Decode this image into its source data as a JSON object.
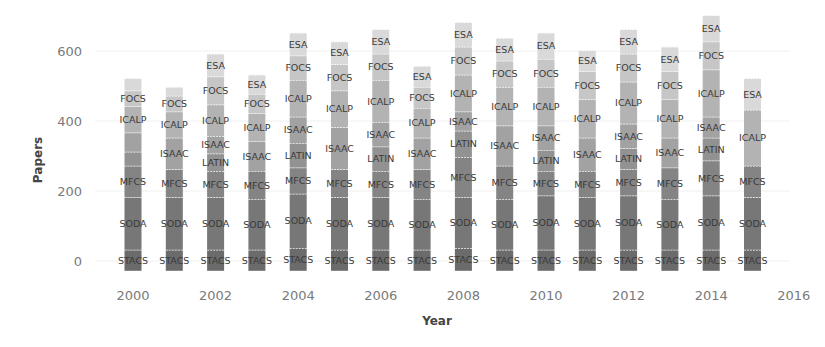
{
  "chart_data": {
    "type": "bar",
    "stacked": true,
    "title": "",
    "xlabel": "Year",
    "ylabel": "Papers",
    "ylim": [
      -28,
      700
    ],
    "yticks": [
      0,
      200,
      400,
      600
    ],
    "xticks": [
      "2000",
      "2002",
      "2004",
      "2006",
      "2008",
      "2010",
      "2012",
      "2014",
      "2016"
    ],
    "grid": false,
    "legend": "none (segments labeled inline)",
    "categories": [
      "2000",
      "2001",
      "2002",
      "2003",
      "2004",
      "2005",
      "2006",
      "2007",
      "2008",
      "2009",
      "2010",
      "2011",
      "2012",
      "2013",
      "2014",
      "2015"
    ],
    "series_order_bottom_to_top": [
      "STACS",
      "SODA",
      "MFCS",
      "LATIN",
      "ISAAC",
      "ICALP",
      "FOCS",
      "ESA"
    ],
    "colors": {
      "STACS": "#6b6b6b",
      "SODA": "#777777",
      "MFCS": "#848484",
      "LATIN": "#929292",
      "ISAAC": "#a2a2a2",
      "ICALP": "#b3b3b3",
      "FOCS": "#c6c6c6",
      "ESA": "#d9d9d9"
    },
    "bars": [
      {
        "year": "2000",
        "segments": [
          [
            "STACS",
            60
          ],
          [
            "SODA",
            150
          ],
          [
            "MFCS",
            90
          ],
          [
            "LATIN",
            40
          ],
          [
            "ISAAC",
            55
          ],
          [
            "ICALP",
            75
          ],
          [
            "FOCS",
            45
          ],
          [
            "ESA",
            35
          ]
        ],
        "labels": [
          "STACS",
          "SODA",
          "MFCS",
          "ICALP",
          "FOCS"
        ]
      },
      {
        "year": "2001",
        "segments": [
          [
            "STACS",
            60
          ],
          [
            "SODA",
            150
          ],
          [
            "MFCS",
            80
          ],
          [
            "ISAAC",
            90
          ],
          [
            "ICALP",
            75
          ],
          [
            "FOCS",
            45
          ],
          [
            "ESA",
            25
          ]
        ],
        "labels": [
          "STACS",
          "SODA",
          "MFCS",
          "ISAAC",
          "ICALP",
          "FOCS"
        ]
      },
      {
        "year": "2002",
        "segments": [
          [
            "STACS",
            60
          ],
          [
            "SODA",
            150
          ],
          [
            "MFCS",
            75
          ],
          [
            "LATIN",
            50
          ],
          [
            "ISAAC",
            50
          ],
          [
            "ICALP",
            90
          ],
          [
            "FOCS",
            80
          ],
          [
            "ESA",
            65
          ]
        ],
        "labels": [
          "STACS",
          "SODA",
          "MFCS",
          "LATIN",
          "ISAAC",
          "ICALP",
          "FOCS",
          "ESA"
        ]
      },
      {
        "year": "2003",
        "segments": [
          [
            "STACS",
            60
          ],
          [
            "SODA",
            145
          ],
          [
            "MFCS",
            80
          ],
          [
            "ISAAC",
            85
          ],
          [
            "ICALP",
            80
          ],
          [
            "FOCS",
            55
          ],
          [
            "ESA",
            55
          ]
        ],
        "labels": [
          "STACS",
          "SODA",
          "MFCS",
          "ISAAC",
          "ICALP",
          "FOCS",
          "ESA"
        ]
      },
      {
        "year": "2004",
        "segments": [
          [
            "STACS",
            65
          ],
          [
            "SODA",
            155
          ],
          [
            "MFCS",
            75
          ],
          [
            "LATIN",
            70
          ],
          [
            "ISAAC",
            75
          ],
          [
            "ICALP",
            105
          ],
          [
            "FOCS",
            70
          ],
          [
            "ESA",
            65
          ]
        ],
        "labels": [
          "STACS",
          "SODA",
          "MFCS",
          "LATIN",
          "ISAAC",
          "ICALP",
          "FOCS",
          "ESA"
        ]
      },
      {
        "year": "2005",
        "segments": [
          [
            "STACS",
            60
          ],
          [
            "SODA",
            150
          ],
          [
            "MFCS",
            80
          ],
          [
            "ISAAC",
            120
          ],
          [
            "ICALP",
            105
          ],
          [
            "FOCS",
            75
          ],
          [
            "ESA",
            65
          ]
        ],
        "labels": [
          "STACS",
          "SODA",
          "MFCS",
          "ISAAC",
          "ICALP",
          "FOCS",
          "ESA"
        ]
      },
      {
        "year": "2006",
        "segments": [
          [
            "STACS",
            60
          ],
          [
            "SODA",
            150
          ],
          [
            "MFCS",
            75
          ],
          [
            "LATIN",
            70
          ],
          [
            "ISAAC",
            70
          ],
          [
            "ICALP",
            120
          ],
          [
            "FOCS",
            75
          ],
          [
            "ESA",
            70
          ]
        ],
        "labels": [
          "STACS",
          "SODA",
          "MFCS",
          "LATIN",
          "ISAAC",
          "ICALP",
          "FOCS",
          "ESA"
        ]
      },
      {
        "year": "2007",
        "segments": [
          [
            "STACS",
            60
          ],
          [
            "SODA",
            145
          ],
          [
            "MFCS",
            85
          ],
          [
            "ISAAC",
            90
          ],
          [
            "ICALP",
            85
          ],
          [
            "FOCS",
            60
          ],
          [
            "ESA",
            60
          ]
        ],
        "labels": [
          "STACS",
          "SODA",
          "MFCS",
          "ISAAC",
          "ICALP",
          "FOCS",
          "ESA"
        ]
      },
      {
        "year": "2008",
        "segments": [
          [
            "STACS",
            65
          ],
          [
            "SODA",
            145
          ],
          [
            "MFCS",
            115
          ],
          [
            "LATIN",
            75
          ],
          [
            "ISAAC",
            55
          ],
          [
            "ICALP",
            105
          ],
          [
            "FOCS",
            80
          ],
          [
            "ESA",
            70
          ]
        ],
        "labels": [
          "STACS",
          "SODA",
          "MFCS",
          "LATIN",
          "ISAAC",
          "ICALP",
          "FOCS",
          "ESA"
        ]
      },
      {
        "year": "2009",
        "segments": [
          [
            "STACS",
            60
          ],
          [
            "SODA",
            145
          ],
          [
            "MFCS",
            95
          ],
          [
            "ISAAC",
            115
          ],
          [
            "ICALP",
            110
          ],
          [
            "FOCS",
            75
          ],
          [
            "ESA",
            65
          ]
        ],
        "labels": [
          "STACS",
          "SODA",
          "MFCS",
          "ISAAC",
          "ICALP",
          "FOCS",
          "ESA"
        ]
      },
      {
        "year": "2010",
        "segments": [
          [
            "STACS",
            60
          ],
          [
            "SODA",
            155
          ],
          [
            "MFCS",
            70
          ],
          [
            "LATIN",
            60
          ],
          [
            "ISAAC",
            70
          ],
          [
            "ICALP",
            110
          ],
          [
            "FOCS",
            80
          ],
          [
            "ESA",
            75
          ]
        ],
        "labels": [
          "STACS",
          "SODA",
          "MFCS",
          "LATIN",
          "ISAAC",
          "ICALP",
          "FOCS",
          "ESA"
        ]
      },
      {
        "year": "2011",
        "segments": [
          [
            "STACS",
            60
          ],
          [
            "SODA",
            150
          ],
          [
            "MFCS",
            75
          ],
          [
            "ISAAC",
            95
          ],
          [
            "ICALP",
            110
          ],
          [
            "FOCS",
            80
          ],
          [
            "ESA",
            60
          ]
        ],
        "labels": [
          "STACS",
          "SODA",
          "MFCS",
          "ISAAC",
          "ICALP",
          "FOCS",
          "ESA"
        ]
      },
      {
        "year": "2012",
        "segments": [
          [
            "STACS",
            60
          ],
          [
            "SODA",
            155
          ],
          [
            "MFCS",
            75
          ],
          [
            "LATIN",
            60
          ],
          [
            "ISAAC",
            70
          ],
          [
            "ICALP",
            120
          ],
          [
            "FOCS",
            80
          ],
          [
            "ESA",
            70
          ]
        ],
        "labels": [
          "STACS",
          "SODA",
          "MFCS",
          "LATIN",
          "ISAAC",
          "ICALP",
          "FOCS",
          "ESA"
        ]
      },
      {
        "year": "2013",
        "segments": [
          [
            "STACS",
            60
          ],
          [
            "SODA",
            145
          ],
          [
            "MFCS",
            90
          ],
          [
            "ISAAC",
            85
          ],
          [
            "ICALP",
            110
          ],
          [
            "FOCS",
            80
          ],
          [
            "ESA",
            70
          ]
        ],
        "labels": [
          "STACS",
          "SODA",
          "MFCS",
          "ISAAC",
          "ICALP",
          "FOCS",
          "ESA"
        ]
      },
      {
        "year": "2014",
        "segments": [
          [
            "STACS",
            60
          ],
          [
            "SODA",
            155
          ],
          [
            "MFCS",
            100
          ],
          [
            "LATIN",
            65
          ],
          [
            "ISAAC",
            60
          ],
          [
            "ICALP",
            135
          ],
          [
            "FOCS",
            80
          ],
          [
            "ESA",
            75
          ]
        ],
        "labels": [
          "STACS",
          "SODA",
          "MFCS",
          "LATIN",
          "ISAAC",
          "ICALP",
          "FOCS",
          "ESA"
        ]
      },
      {
        "year": "2015",
        "segments": [
          [
            "STACS",
            60
          ],
          [
            "SODA",
            150
          ],
          [
            "MFCS",
            90
          ],
          [
            "ICALP",
            160
          ],
          [
            "ESA",
            90
          ]
        ],
        "labels": [
          "STACS",
          "SODA",
          "MFCS",
          "ICALP",
          "ESA"
        ]
      }
    ]
  }
}
